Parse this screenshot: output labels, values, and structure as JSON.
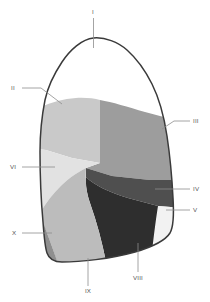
{
  "figure": {
    "view": "lateral",
    "background_color": "#ffffff",
    "outline_color": "#3a3a3a",
    "leader_color": "#8d8d8d",
    "label_color": "#555555"
  },
  "segments": [
    {
      "id": "I",
      "label": "I",
      "name": "apical-segment",
      "color": "#ffffff"
    },
    {
      "id": "II",
      "label": "II",
      "name": "posterior-segment",
      "color": "#c9c9c9"
    },
    {
      "id": "III",
      "label": "III",
      "name": "anterior-segment",
      "color": "#9d9d9d"
    },
    {
      "id": "IV",
      "label": "IV",
      "name": "lateral-segment",
      "color": "#4f4f4f"
    },
    {
      "id": "V",
      "label": "V",
      "name": "medial-segment",
      "color": "#f2f2f2"
    },
    {
      "id": "VI",
      "label": "VI",
      "name": "superior-segment",
      "color": "#e2e2e2"
    },
    {
      "id": "VIII",
      "label": "VIII",
      "name": "anterior-basal-segment",
      "color": "#2e2e2e"
    },
    {
      "id": "IX",
      "label": "IX",
      "name": "lateral-basal-segment",
      "color": "#bcbcbc"
    },
    {
      "id": "X",
      "label": "X",
      "name": "posterior-basal-segment",
      "color": "#8f8f8f"
    }
  ],
  "labels": {
    "I": {
      "text": "I",
      "x": 93,
      "y": 14
    },
    "II": {
      "text": "II",
      "x": 13,
      "y": 90
    },
    "III": {
      "text": "III",
      "x": 196,
      "y": 123
    },
    "IV": {
      "text": "IV",
      "x": 195,
      "y": 191
    },
    "V": {
      "text": "V",
      "x": 195,
      "y": 212
    },
    "VI": {
      "text": "VI",
      "x": 12,
      "y": 169
    },
    "VIII": {
      "text": "VIII",
      "x": 138,
      "y": 280
    },
    "IX": {
      "text": "IX",
      "x": 88,
      "y": 293
    },
    "X": {
      "text": "X",
      "x": 14,
      "y": 235
    }
  }
}
